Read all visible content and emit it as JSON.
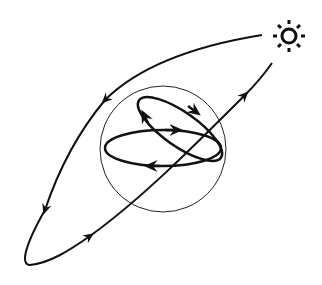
{
  "diagram": {
    "title": "",
    "colors": {
      "stroke": "#111111",
      "background": "#ffffff"
    },
    "elements": [
      {
        "id": "sun",
        "type": "icon",
        "icon": "sun-icon",
        "cx": 289,
        "cy": 36
      },
      {
        "id": "large-orbit",
        "type": "path",
        "description": "large elongated trajectory looping from sun around lower-left and back"
      },
      {
        "id": "sphere",
        "type": "circle",
        "cx": 163,
        "cy": 149,
        "r": 63
      },
      {
        "id": "equatorial-orbit",
        "type": "ellipse",
        "description": "horizontal orbit inside sphere"
      },
      {
        "id": "inclined-orbit",
        "type": "ellipse",
        "description": "tilted orbit inside sphere"
      }
    ],
    "labels": []
  }
}
